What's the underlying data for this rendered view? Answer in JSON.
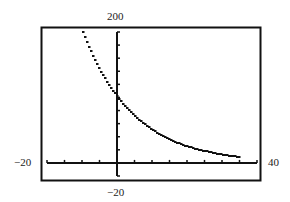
{
  "window": {
    "ymax_label": "200",
    "ymin_label": "−20",
    "xmin_label": "−20",
    "xmax_label": "40"
  },
  "chart_data": {
    "type": "line",
    "title": "",
    "xlabel": "",
    "ylabel": "",
    "xlim": [
      -20,
      40
    ],
    "ylim": [
      -20,
      200
    ],
    "x_tick_spacing": 5,
    "y_tick_spacing": 20,
    "grid": false,
    "legend": null,
    "series": [
      {
        "name": "exponential decay",
        "x": [
          -10,
          -5,
          0,
          5,
          10,
          15,
          20,
          25,
          30,
          35
        ],
        "values": [
          200,
          141,
          100,
          71,
          50,
          35,
          25,
          18,
          12.5,
          9
        ]
      }
    ],
    "annotations": [
      "Graphing calculator window: Xmin=-20, Xmax=40, Ymin=-20, Ymax=200"
    ]
  }
}
